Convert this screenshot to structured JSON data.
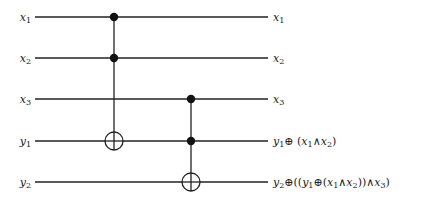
{
  "diagram": {
    "type": "quantum-circuit",
    "wire_color": "#222222",
    "wires": [
      {
        "name": "x1",
        "left_label": "x",
        "left_sub": "1",
        "y": 17,
        "output": [
          {
            "t": "x"
          },
          {
            "t": "1",
            "sub": true
          }
        ]
      },
      {
        "name": "x2",
        "left_label": "x",
        "left_sub": "2",
        "y": 58,
        "output": [
          {
            "t": "x"
          },
          {
            "t": "2",
            "sub": true
          }
        ]
      },
      {
        "name": "x3",
        "left_label": "x",
        "left_sub": "3",
        "y": 99,
        "output": [
          {
            "t": "x"
          },
          {
            "t": "3",
            "sub": true
          }
        ]
      },
      {
        "name": "y1",
        "left_label": "y",
        "left_sub": "1",
        "y": 141,
        "output": [
          {
            "t": "y"
          },
          {
            "t": "1",
            "sub": true
          },
          {
            "t": "⊕ ",
            "op": true
          },
          {
            "t": "(",
            "op": true
          },
          {
            "t": "x"
          },
          {
            "t": "1",
            "sub": true
          },
          {
            "t": "∧",
            "op": true
          },
          {
            "t": "x"
          },
          {
            "t": "2",
            "sub": true
          },
          {
            "t": ")",
            "op": true
          }
        ]
      },
      {
        "name": "y2",
        "left_label": "y",
        "left_sub": "2",
        "y": 182,
        "output": [
          {
            "t": "y"
          },
          {
            "t": "2",
            "sub": true
          },
          {
            "t": "⊕((",
            "op": true
          },
          {
            "t": "y"
          },
          {
            "t": "1",
            "sub": true
          },
          {
            "t": "⊕(",
            "op": true
          },
          {
            "t": "x"
          },
          {
            "t": "1",
            "sub": true
          },
          {
            "t": "∧",
            "op": true
          },
          {
            "t": "x"
          },
          {
            "t": "2",
            "sub": true
          },
          {
            "t": "))∧",
            "op": true
          },
          {
            "t": "x"
          },
          {
            "t": "3",
            "sub": true
          },
          {
            "t": ")",
            "op": true
          }
        ]
      }
    ],
    "gates": [
      {
        "name": "toffoli-1",
        "x": 114,
        "controls": [
          0,
          1
        ],
        "target": 3
      },
      {
        "name": "toffoli-2",
        "x": 191,
        "controls": [
          2,
          3
        ],
        "target": 4
      }
    ],
    "wire_start_x": 35,
    "wire_end_x": 268,
    "output_label_x": 273
  }
}
